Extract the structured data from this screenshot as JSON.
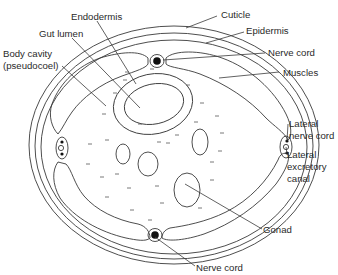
{
  "diagram": {
    "labels": {
      "endodermis": "Endodermis",
      "gut_lumen": "Gut lumen",
      "body_cavity_1": "Body cavity",
      "body_cavity_2": "(pseudocoel)",
      "cuticle": "Cuticle",
      "epidermis": "Epidermis",
      "nerve_cord_top": "Nerve cord",
      "muscles": "Muscles",
      "lateral_nerve_cord_1": "Lateral",
      "lateral_nerve_cord_2": "nerve cord",
      "lateral_excretory_1": "Lateral",
      "lateral_excretory_2": "excretory",
      "lateral_excretory_3": "canal",
      "gonad": "Gonad",
      "nerve_cord_bottom": "Nerve cord"
    },
    "colors": {
      "line": "#3a3a3a",
      "text": "#2a2a2a",
      "background": "#ffffff"
    }
  }
}
